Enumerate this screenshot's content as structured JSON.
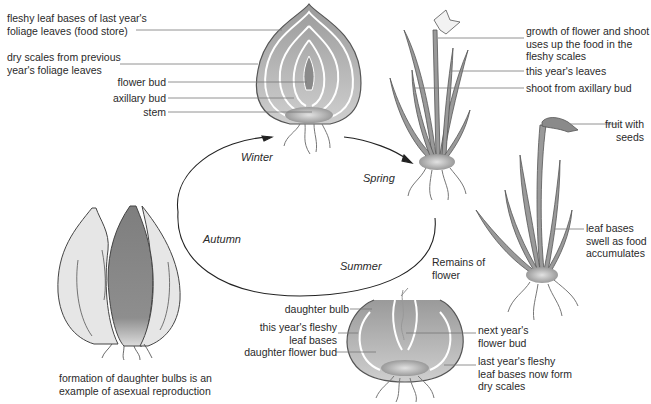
{
  "colors": {
    "fleshy": "#9a9a9a",
    "fleshy_light": "#c8c8c8",
    "outline": "#555555",
    "leader": "#777777",
    "cycle": "#222222",
    "onion_light": "#e6e6e6",
    "onion_dark": "#8a8a8a"
  },
  "seasons": {
    "winter": "Winter",
    "spring": "Spring",
    "summer": "Summer",
    "autumn": "Autumn"
  },
  "winter_bulb": {
    "labels": {
      "fleshy_leaf_bases": "fleshy leaf bases of last year's\nfoliage leaves (food store)",
      "dry_scales": "dry scales from previous\nyear's foliage leaves",
      "flower_bud": "flower bud",
      "axillary_bud": "axillary bud",
      "stem": "stem"
    }
  },
  "spring_plant": {
    "labels": {
      "growth": "growth of flower and shoot\nuses up the food in the\nfleshy scales",
      "this_years_leaves": "this year's leaves",
      "shoot": "shoot from axillary bud"
    }
  },
  "summer_plant": {
    "labels": {
      "fruit": "fruit with\nseeds",
      "leaf_bases_swell": "leaf bases\nswell as food\naccumulates"
    }
  },
  "autumn_bulb": {
    "labels": {
      "remains": "Remains of\nflower",
      "daughter_bulb": "daughter bulb",
      "fleshy_bases": "this year's fleshy\nleaf bases",
      "daughter_flower_bud": "daughter flower bud",
      "next_flower_bud": "next year's\nflower bud",
      "dry_scales": "last year's fleshy\nleaf bases now form\ndry scales"
    }
  },
  "onion": {
    "caption": "formation of daughter bulbs is an\nexample of asexual reproduction"
  }
}
